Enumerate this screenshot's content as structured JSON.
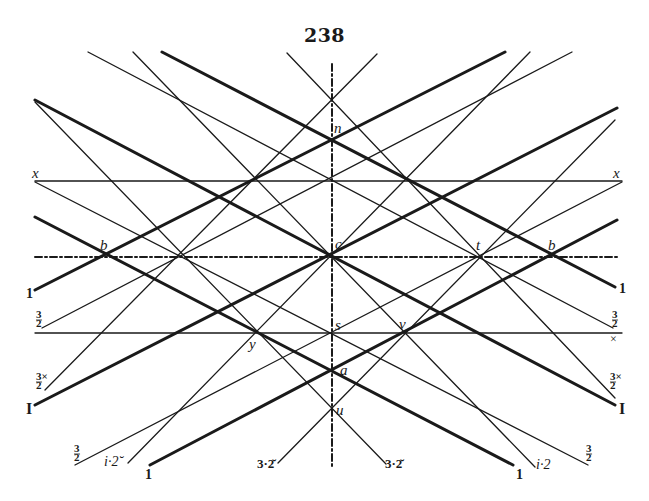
{
  "page": {
    "number": "238",
    "ink_color": "#1a1a1a",
    "background": "#ffffff"
  },
  "figure": {
    "lines": [
      {
        "name": "vertical-axis",
        "x1": 332,
        "y1": 64,
        "x2": 332,
        "y2": 467,
        "w": 2.0,
        "dash": "7 3 2 3"
      },
      {
        "name": "horizontal-axis",
        "x1": 35,
        "y1": 257,
        "x2": 618,
        "y2": 257,
        "w": 2.0,
        "dash": "7 3 2 3"
      },
      {
        "name": "line-x-x",
        "x1": 35,
        "y1": 181,
        "x2": 622,
        "y2": 181,
        "w": 1.3
      },
      {
        "name": "line-y-s-v",
        "x1": 35,
        "y1": 333,
        "x2": 622,
        "y2": 333,
        "w": 1.3
      },
      {
        "name": "line-thin-a",
        "x1": 35,
        "y1": 102,
        "x2": 386,
        "y2": 464,
        "w": 1.3
      },
      {
        "name": "line-thick-I-right",
        "x1": 35,
        "y1": 100,
        "x2": 615,
        "y2": 405,
        "w": 3.0
      },
      {
        "name": "line-thin-x-left",
        "x1": 35,
        "y1": 182,
        "x2": 588,
        "y2": 465,
        "w": 1.3
      },
      {
        "name": "line-thick-1-bottom-right",
        "x1": 35,
        "y1": 217,
        "x2": 513,
        "y2": 465,
        "w": 3.0
      },
      {
        "name": "line-thick-1-left",
        "x1": 35,
        "y1": 290,
        "x2": 505,
        "y2": 52,
        "w": 3.0
      },
      {
        "name": "line-thin-3-2-left",
        "x1": 42,
        "y1": 328,
        "x2": 572,
        "y2": 52,
        "w": 1.3
      },
      {
        "name": "line-thin-3x-2-left",
        "x1": 45,
        "y1": 390,
        "x2": 377,
        "y2": 54,
        "w": 1.3
      },
      {
        "name": "line-thick-I-left",
        "x1": 35,
        "y1": 405,
        "x2": 617,
        "y2": 108,
        "w": 3.0
      },
      {
        "name": "line-thin-3-2-bottom-left",
        "x1": 75,
        "y1": 465,
        "x2": 622,
        "y2": 182,
        "w": 1.3
      },
      {
        "name": "line-thin-i2-left",
        "x1": 128,
        "y1": 463,
        "x2": 530,
        "y2": 52,
        "w": 1.3
      },
      {
        "name": "line-thick-1-bottom-left",
        "x1": 150,
        "y1": 465,
        "x2": 617,
        "y2": 220,
        "w": 3.0
      },
      {
        "name": "line-thin-3-2-breve-left",
        "x1": 278,
        "y1": 463,
        "x2": 615,
        "y2": 120,
        "w": 1.3
      },
      {
        "name": "line-thin-i2-right",
        "x1": 535,
        "y1": 467,
        "x2": 133,
        "y2": 52,
        "w": 1.3
      },
      {
        "name": "line-thin-3-2-right",
        "x1": 88,
        "y1": 52,
        "x2": 613,
        "y2": 328,
        "w": 1.3
      },
      {
        "name": "line-thick-1-right",
        "x1": 162,
        "y1": 52,
        "x2": 615,
        "y2": 287,
        "w": 3.0
      },
      {
        "name": "line-thin-3x-2-right",
        "x1": 287,
        "y1": 53,
        "x2": 615,
        "y2": 398,
        "w": 1.3
      }
    ],
    "points": [
      {
        "name": "point-n",
        "text": "n",
        "x": 334,
        "y": 133,
        "italic": true
      },
      {
        "name": "point-c",
        "text": "c",
        "x": 335,
        "y": 249,
        "italic": true
      },
      {
        "name": "point-b-left",
        "text": "b",
        "x": 100,
        "y": 250,
        "italic": true
      },
      {
        "name": "point-b-right",
        "text": "b",
        "x": 548,
        "y": 250,
        "italic": true
      },
      {
        "name": "point-t",
        "text": "t",
        "x": 476,
        "y": 250,
        "italic": true
      },
      {
        "name": "point-s",
        "text": "s",
        "x": 335,
        "y": 330,
        "italic": true
      },
      {
        "name": "point-v",
        "text": "v",
        "x": 399,
        "y": 329,
        "italic": true
      },
      {
        "name": "point-y",
        "text": "y",
        "x": 249,
        "y": 349,
        "italic": true
      },
      {
        "name": "point-a",
        "text": "a",
        "x": 340,
        "y": 375,
        "italic": true
      },
      {
        "name": "point-u",
        "text": "u",
        "x": 336,
        "y": 415,
        "italic": true
      }
    ],
    "labels": [
      {
        "name": "label-x-left",
        "text": "x",
        "x": 32,
        "y": 178,
        "italic": true,
        "size": 15
      },
      {
        "name": "label-x-right",
        "text": "x",
        "x": 613,
        "y": 178,
        "italic": true,
        "size": 15
      },
      {
        "name": "label-1-left",
        "text": "1",
        "x": 26,
        "y": 298,
        "bold": true,
        "size": 14
      },
      {
        "name": "label-3-2-left",
        "num": "3",
        "den": "2",
        "x": 36,
        "y": 318,
        "size": 11
      },
      {
        "name": "label-3x-2-left",
        "num": "3×",
        "den": "2",
        "x": 36,
        "y": 380,
        "size": 11
      },
      {
        "name": "label-I-left",
        "text": "I",
        "x": 26,
        "y": 414,
        "bold": true,
        "size": 16
      },
      {
        "name": "label-3-2-bottom-left",
        "num": "3",
        "den": "2",
        "x": 74,
        "y": 452,
        "size": 11
      },
      {
        "name": "label-i2-left",
        "text": "i·2̆",
        "x": 104,
        "y": 466,
        "italic": true,
        "size": 14
      },
      {
        "name": "label-1-bottom-left",
        "text": "1",
        "x": 145,
        "y": 479,
        "bold": true,
        "size": 14
      },
      {
        "name": "label-3-2-breve-left",
        "text": "3·2̆",
        "x": 257,
        "y": 468,
        "bold": true,
        "size": 13
      },
      {
        "name": "label-3-2-breve-right",
        "text": "3·2̆",
        "x": 385,
        "y": 468,
        "bold": true,
        "size": 13
      },
      {
        "name": "label-1-bottom-right",
        "text": "1",
        "x": 516,
        "y": 479,
        "bold": true,
        "size": 14
      },
      {
        "name": "label-i2-right",
        "text": "i·2",
        "x": 536,
        "y": 469,
        "italic": true,
        "size": 14
      },
      {
        "name": "label-3-2-bottom-right",
        "num": "3",
        "den": "2",
        "x": 586,
        "y": 452,
        "size": 11
      },
      {
        "name": "label-1-right",
        "text": "1",
        "x": 619,
        "y": 293,
        "bold": true,
        "size": 14
      },
      {
        "name": "label-3-2-right",
        "num": "3",
        "den": "2",
        "x": 612,
        "y": 318,
        "size": 11
      },
      {
        "name": "label-x-breve-right",
        "text": "×",
        "x": 610,
        "y": 343,
        "size": 12
      },
      {
        "name": "label-3x-2-right",
        "num": "3×",
        "den": "2",
        "x": 610,
        "y": 380,
        "size": 11
      },
      {
        "name": "label-I-right",
        "text": "I",
        "x": 619,
        "y": 414,
        "bold": true,
        "size": 16
      }
    ]
  }
}
